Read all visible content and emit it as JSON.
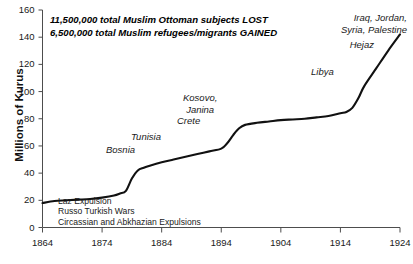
{
  "chart_data": {
    "type": "line",
    "title": "",
    "xlabel": "",
    "ylabel": "Millions of Kurus",
    "xlim": [
      1864,
      1924
    ],
    "ylim": [
      0,
      160
    ],
    "xticks": [
      1864,
      1874,
      1884,
      1894,
      1904,
      1914,
      1924
    ],
    "xtick_labels": [
      "1864",
      "1874",
      "1884",
      "1894",
      "1904",
      "1914",
      "1924"
    ],
    "yticks": [
      0,
      20,
      40,
      60,
      80,
      100,
      120,
      140,
      160
    ],
    "ytick_labels": [
      "0",
      "20",
      "40",
      "60",
      "80",
      "100",
      "120",
      "140",
      "160"
    ],
    "grid": false,
    "legend": false,
    "series": [
      {
        "name": "Ottoman public debt",
        "color": "#111111",
        "x": [
          1864,
          1866,
          1868,
          1870,
          1872,
          1874,
          1876,
          1877,
          1878,
          1879,
          1880,
          1881,
          1882,
          1884,
          1886,
          1888,
          1890,
          1892,
          1894,
          1895,
          1896,
          1897,
          1898,
          1900,
          1902,
          1904,
          1906,
          1908,
          1910,
          1912,
          1914,
          1915,
          1916,
          1917,
          1918,
          1920,
          1922,
          1924
        ],
        "y": [
          18,
          19.5,
          20,
          20.5,
          21,
          22,
          23.5,
          25,
          27,
          36,
          42,
          44,
          45.5,
          48,
          50,
          52,
          54,
          56,
          58,
          62,
          68,
          73,
          75.5,
          77,
          78,
          79,
          79.5,
          80,
          81,
          82,
          84,
          85,
          88,
          95,
          104,
          117,
          130,
          142
        ]
      }
    ],
    "annotations": [
      {
        "name": "headline",
        "lines": [
          "11,500,000 total Muslim Ottoman subjects LOST",
          "6,500,000 total Muslim refugees/migrants GAINED"
        ],
        "style": "bold-italic"
      },
      {
        "name": "event-notes",
        "lines": [
          "Laz Expulsion",
          "Russo Turkish Wars",
          "Circassian and Abkhazian Expulsions"
        ],
        "style": "plain"
      },
      {
        "name": "bosnia",
        "lines": [
          "Bosnia"
        ],
        "style": "italic"
      },
      {
        "name": "tunisia",
        "lines": [
          "Tunisia"
        ],
        "style": "italic"
      },
      {
        "name": "kosovo-janina-crete",
        "lines": [
          "Kosovo,",
          "Janina",
          "Crete"
        ],
        "style": "italic"
      },
      {
        "name": "libya",
        "lines": [
          "Libya"
        ],
        "style": "italic"
      },
      {
        "name": "hejaz",
        "lines": [
          "Hejaz"
        ],
        "style": "italic"
      },
      {
        "name": "mandates",
        "lines": [
          "Iraq, Jordan,",
          "Syria, Palestine"
        ],
        "style": "italic"
      }
    ]
  },
  "labels": {
    "y_axis_title": "Millions of Kurus",
    "headline_line1": "11,500,000 total Muslim Ottoman subjects LOST",
    "headline_line2": "6,500,000 total Muslim refugees/migrants GAINED",
    "note_line1": "Laz Expulsion",
    "note_line2": "Russo Turkish Wars",
    "note_line3": "Circassian and Abkhazian Expulsions",
    "bosnia": "Bosnia",
    "tunisia": "Tunisia",
    "kosovo": "Kosovo,",
    "janina": "Janina",
    "crete": "Crete",
    "libya": "Libya",
    "hejaz": "Hejaz",
    "mandates_line1": "Iraq, Jordan,",
    "mandates_line2": "Syria, Palestine",
    "y0": "0",
    "y20": "20",
    "y40": "40",
    "y60": "60",
    "y80": "80",
    "y100": "100",
    "y120": "120",
    "y140": "140",
    "y160": "160",
    "x1864": "1864",
    "x1874": "1874",
    "x1884": "1884",
    "x1894": "1894",
    "x1904": "1904",
    "x1914": "1914",
    "x1924": "1924"
  },
  "colors": {
    "line": "#111111",
    "axis": "#4d4d4d",
    "text": "#1a1a1a",
    "background": "#ffffff"
  }
}
